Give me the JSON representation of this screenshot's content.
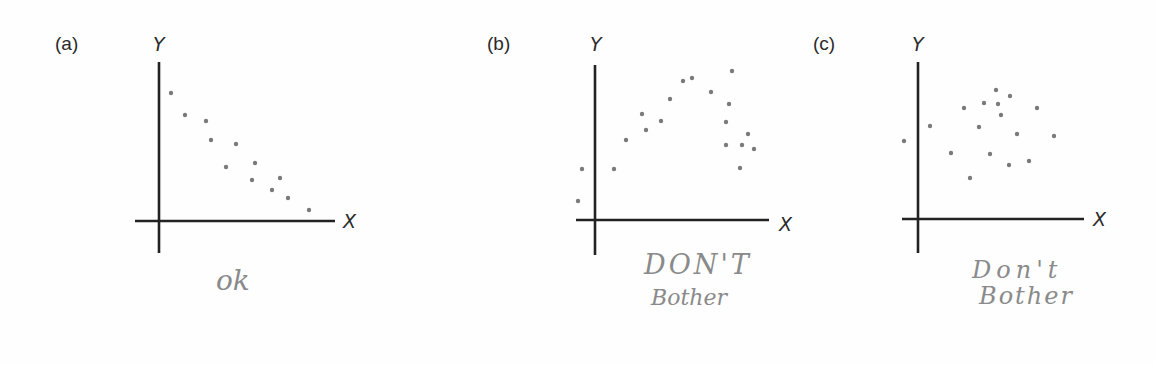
{
  "chart_data": [
    {
      "type": "scatter",
      "panel": "(a)",
      "xlabel": "X",
      "ylabel": "Y",
      "annotation": "ok",
      "grid": false,
      "ticks": false,
      "description": "Strong negative linear relationship",
      "origin_px": [
        159,
        221
      ],
      "points_px": [
        [
          171,
          93
        ],
        [
          185,
          115
        ],
        [
          206,
          121
        ],
        [
          211,
          140
        ],
        [
          236,
          144
        ],
        [
          226,
          167
        ],
        [
          255,
          163
        ],
        [
          252,
          180
        ],
        [
          280,
          178
        ],
        [
          272,
          190
        ],
        [
          288,
          198
        ],
        [
          309,
          210
        ]
      ],
      "points": [
        [
          0.6,
          6.4
        ],
        [
          1.3,
          5.3
        ],
        [
          2.35,
          5.0
        ],
        [
          2.6,
          4.05
        ],
        [
          3.85,
          3.85
        ],
        [
          3.35,
          2.7
        ],
        [
          4.8,
          2.9
        ],
        [
          4.65,
          2.05
        ],
        [
          6.05,
          2.15
        ],
        [
          5.65,
          1.55
        ],
        [
          6.45,
          1.15
        ],
        [
          7.5,
          0.55
        ]
      ]
    },
    {
      "type": "scatter",
      "panel": "(b)",
      "xlabel": "X",
      "ylabel": "Y",
      "annotation": "Don't Bother",
      "grid": false,
      "ticks": false,
      "description": "Curvilinear (inverted-U) relationship",
      "origin_px": [
        595,
        220
      ],
      "points_px": [
        [
          578,
          201
        ],
        [
          582,
          169
        ],
        [
          614,
          169
        ],
        [
          626,
          140
        ],
        [
          642,
          114
        ],
        [
          646,
          130
        ],
        [
          661,
          121
        ],
        [
          670,
          99
        ],
        [
          683,
          81
        ],
        [
          692,
          78
        ],
        [
          711,
          92
        ],
        [
          732,
          71
        ],
        [
          729,
          104
        ],
        [
          726,
          122
        ],
        [
          726,
          145
        ],
        [
          748,
          134
        ],
        [
          742,
          145
        ],
        [
          754,
          149
        ],
        [
          740,
          168
        ]
      ],
      "points": [
        [
          -0.85,
          0.95
        ],
        [
          -0.65,
          2.55
        ],
        [
          0.95,
          2.55
        ],
        [
          1.55,
          4.0
        ],
        [
          2.35,
          5.3
        ],
        [
          2.55,
          4.5
        ],
        [
          3.3,
          4.95
        ],
        [
          3.75,
          6.05
        ],
        [
          4.4,
          6.95
        ],
        [
          4.85,
          7.1
        ],
        [
          5.8,
          6.4
        ],
        [
          6.85,
          7.45
        ],
        [
          6.7,
          5.8
        ],
        [
          6.55,
          4.9
        ],
        [
          6.55,
          3.75
        ],
        [
          7.65,
          4.3
        ],
        [
          7.35,
          3.75
        ],
        [
          7.95,
          3.55
        ],
        [
          7.25,
          2.6
        ]
      ]
    },
    {
      "type": "scatter",
      "panel": "(c)",
      "xlabel": "X",
      "ylabel": "Y",
      "annotation": "Don't Bother",
      "grid": false,
      "ticks": false,
      "description": "No apparent relationship",
      "origin_px": [
        918,
        219
      ],
      "points_px": [
        [
          904,
          141
        ],
        [
          930,
          126
        ],
        [
          951,
          153
        ],
        [
          970,
          178
        ],
        [
          964,
          108
        ],
        [
          979,
          127
        ],
        [
          984,
          103
        ],
        [
          990,
          154
        ],
        [
          996,
          90
        ],
        [
          998,
          104
        ],
        [
          1001,
          115
        ],
        [
          1010,
          96
        ],
        [
          1009,
          165
        ],
        [
          1017,
          134
        ],
        [
          1029,
          161
        ],
        [
          1037,
          108
        ],
        [
          1054,
          136
        ]
      ],
      "points": [
        [
          -0.7,
          3.9
        ],
        [
          0.6,
          4.65
        ],
        [
          1.65,
          3.3
        ],
        [
          2.6,
          2.05
        ],
        [
          2.3,
          5.55
        ],
        [
          3.05,
          4.6
        ],
        [
          3.3,
          5.8
        ],
        [
          3.6,
          3.25
        ],
        [
          3.9,
          6.45
        ],
        [
          4.0,
          5.75
        ],
        [
          4.15,
          5.2
        ],
        [
          4.6,
          6.15
        ],
        [
          4.55,
          2.7
        ],
        [
          4.95,
          4.25
        ],
        [
          5.55,
          2.9
        ],
        [
          5.95,
          5.55
        ],
        [
          6.8,
          4.15
        ]
      ]
    }
  ],
  "panels": {
    "a": {
      "label": "(a)",
      "x_axis": "X",
      "y_axis": "Y",
      "note": "ok"
    },
    "b": {
      "label": "(b)",
      "x_axis": "X",
      "y_axis": "Y",
      "note_line1": "DON'T",
      "note_line2": "Bother"
    },
    "c": {
      "label": "(c)",
      "x_axis": "X",
      "y_axis": "Y",
      "note_line1": "Don't",
      "note_line2": "Bother"
    }
  },
  "colors": {
    "axis": "#222222",
    "point": "#7a7a7a",
    "text": "#2a2a2a",
    "handwriting": "#8a8a8a"
  }
}
